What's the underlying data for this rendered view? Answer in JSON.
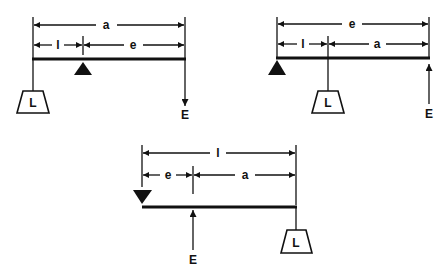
{
  "colors": {
    "ink": "#111111",
    "background": "#ffffff"
  },
  "diagrams": [
    {
      "id": "first-class-lever",
      "dimensions": {
        "outer": "a",
        "inner_left": "l",
        "inner_right": "e"
      },
      "load_label": "L",
      "effort_label": "E",
      "fulcrum": "triangle-below-beam",
      "effort_direction": "down"
    },
    {
      "id": "second-class-lever",
      "dimensions": {
        "outer": "e",
        "inner_left": "l",
        "inner_right": "a"
      },
      "load_label": "L",
      "effort_label": "E",
      "fulcrum": "triangle-below-beam-left-end",
      "effort_direction": "up"
    },
    {
      "id": "third-class-lever",
      "dimensions": {
        "outer": "l",
        "inner_left": "e",
        "inner_right": "a"
      },
      "load_label": "L",
      "effort_label": "E",
      "fulcrum": "inverted-triangle-above-beam-left-end",
      "effort_direction": "up"
    }
  ]
}
